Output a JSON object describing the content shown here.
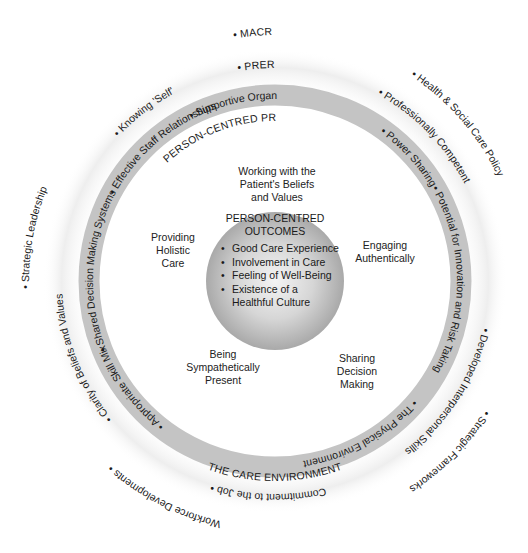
{
  "diagram": {
    "colors": {
      "band": "#c4c4c4",
      "halo": "#ececec",
      "core_light": "#f2f2f2",
      "core_dark": "#a8a8a8",
      "text": "#1a1a1a"
    },
    "macro_context": {
      "label": "• MACRO CONTEXT",
      "items": [
        "• Health & Social Care Policy",
        "• Strategic Frameworks",
        "Workforce Developments •",
        "• Strategic Leadership"
      ]
    },
    "prerequisites": {
      "label": "• PREREQUISITES",
      "items": [
        "• Professionally Competent",
        "• Developed Interpersonal Skills",
        "Commitment to the Job •",
        "• Clarity of Beliefs and Values",
        "• Knowing 'Self'"
      ]
    },
    "care_environment": {
      "label": "THE CARE ENVIRONMENT",
      "items": [
        "• Supportive Organisational Systems",
        "• Power Sharing",
        "• Potential for Innovation and Risk Taking",
        "• The Physical Environment",
        "• Appropriate Skill Mix",
        "• Shared Decision Making Systems",
        "• Effective Staff Relationships"
      ]
    },
    "processes": {
      "label": "PERSON-CENTRED PROCESSES",
      "items": [
        [
          "Working with the",
          "Patient's Beliefs",
          "and Values"
        ],
        [
          "Engaging",
          "Authentically"
        ],
        [
          "Sharing",
          "Decision",
          "Making"
        ],
        [
          "Being",
          "Sympathetically",
          "Present"
        ],
        [
          "Providing",
          "Holistic",
          "Care"
        ]
      ]
    },
    "outcomes": {
      "title_line1": "PERSON-CENTRED",
      "title_line2": "OUTCOMES",
      "items": [
        "Good Care Experience",
        "Involvement in Care",
        "Feeling of Well-Being",
        "Existence of a",
        "Healthful Culture"
      ]
    }
  }
}
